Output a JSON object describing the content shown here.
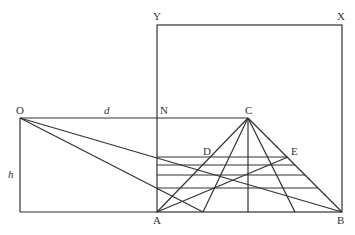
{
  "diagram": {
    "labels": {
      "Y": "Y",
      "X": "X",
      "O": "O",
      "d": "d",
      "N": "N",
      "C": "C",
      "D": "D",
      "E": "E",
      "h": "h",
      "A": "A",
      "B": "B"
    },
    "line_color": "#333333"
  }
}
